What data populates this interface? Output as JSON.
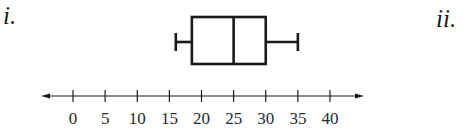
{
  "labels": {
    "part_i": "i.",
    "part_ii": "ii."
  },
  "chart_data": {
    "type": "boxplot",
    "title": "",
    "xlabel": "",
    "ylabel": "",
    "orientation": "horizontal",
    "series": [
      {
        "name": "i.",
        "min": 16,
        "q1": 18.5,
        "median": 25,
        "q3": 30,
        "max": 35
      }
    ],
    "axis": {
      "min": 0,
      "max": 40,
      "step": 5,
      "ticks": [
        0,
        5,
        10,
        15,
        20,
        25,
        30,
        35,
        40
      ],
      "tick_labels": [
        "0",
        "5",
        "10",
        "15",
        "20",
        "25",
        "30",
        "35",
        "40"
      ],
      "arrows": "both"
    },
    "grid": false,
    "legend": "none",
    "colors": {
      "stroke": "#1a1a1a",
      "background": "#ffffff"
    }
  }
}
